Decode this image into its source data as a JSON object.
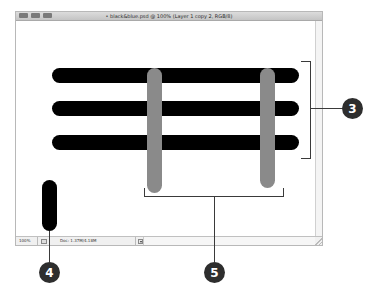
{
  "window": {
    "title": "black&blue.psd @ 100% (Layer 1 copy 2, RGB/8)",
    "title_prefix": "• ",
    "traffic_buttons": [
      "close-button",
      "minimize-button",
      "zoom-button"
    ]
  },
  "statusbar": {
    "zoom": "100%",
    "doc_info": "Doc: 1.37M/4.18M",
    "menu_arrow": "▼"
  },
  "canvas": {
    "colors": {
      "black_bar": "#000000",
      "gray_bar": "#8a8a8a"
    },
    "horizontal_bars": [
      {
        "name": "black-bar-1"
      },
      {
        "name": "black-bar-2"
      },
      {
        "name": "black-bar-3"
      }
    ],
    "vertical_bars": [
      {
        "name": "gray-bar-1"
      },
      {
        "name": "gray-bar-2"
      }
    ],
    "pill": {
      "name": "black-pill"
    }
  },
  "callouts": [
    {
      "id": "3",
      "label": "3"
    },
    {
      "id": "4",
      "label": "4"
    },
    {
      "id": "5",
      "label": "5"
    }
  ]
}
